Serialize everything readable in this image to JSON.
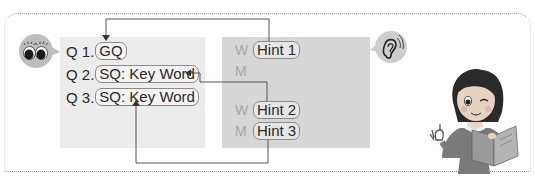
{
  "diagram": {
    "questions": [
      {
        "number": "Q 1.",
        "label": "GQ"
      },
      {
        "number": "Q 2.",
        "label": "SQ: Key Word"
      },
      {
        "number": "Q 3.",
        "label": "SQ: Key Word"
      }
    ],
    "hints": [
      {
        "speaker": "W",
        "label": "Hint 1"
      },
      {
        "speaker": "M",
        "label": ""
      },
      {
        "speaker": "W",
        "label": "Hint 2"
      },
      {
        "speaker": "M",
        "label": "Hint 3"
      }
    ],
    "icons": {
      "left_bubble": "eyes-icon",
      "right_bubble": "ear-icon",
      "illustration": "girl-reading-book-illustration"
    },
    "connections": [
      {
        "from": "Hint 1",
        "to": "Q 1"
      },
      {
        "from": "Hint 2",
        "to": "Q 2"
      },
      {
        "from": "Hint 3",
        "to": "Q 3"
      }
    ],
    "colors": {
      "left_panel": "#ececec",
      "right_panel": "#d6d6d6",
      "bubble": "#bdbdbd",
      "line": "#555555"
    }
  }
}
